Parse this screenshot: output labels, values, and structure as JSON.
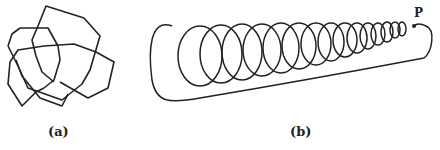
{
  "figure": {
    "panels": [
      {
        "id": "a",
        "caption": "(a)",
        "description": "polygonal knot"
      },
      {
        "id": "b",
        "caption": "(b)",
        "description": "helical coil knot closed by a return loop",
        "point_label": "P"
      }
    ],
    "colors": {
      "stroke": "#222222",
      "background": "#ffffff"
    }
  }
}
